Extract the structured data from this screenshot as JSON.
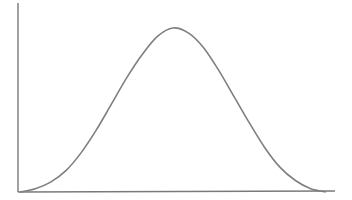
{
  "chart_data": {
    "type": "line",
    "title": "",
    "xlabel": "",
    "ylabel": "",
    "grid": false,
    "legend": null,
    "x": [
      0,
      0.05,
      0.1,
      0.15,
      0.2,
      0.25,
      0.3,
      0.35,
      0.4,
      0.45,
      0.5,
      0.55,
      0.6,
      0.65,
      0.7,
      0.75,
      0.8,
      0.85,
      0.9,
      0.95,
      1.0
    ],
    "series": [
      {
        "name": "curve",
        "values": [
          0.0,
          0.02,
          0.06,
          0.13,
          0.24,
          0.38,
          0.54,
          0.7,
          0.84,
          0.95,
          1.0,
          0.97,
          0.88,
          0.74,
          0.58,
          0.42,
          0.27,
          0.15,
          0.07,
          0.02,
          0.0
        ]
      }
    ],
    "xlim": [
      0,
      1
    ],
    "ylim": [
      0,
      1.2
    ],
    "colors": {
      "axis": "#7a7a7a",
      "curve": "#7f7f7f",
      "background": "#ffffff"
    },
    "plot_area": {
      "origin_x": 18,
      "origin_y": 192,
      "x_axis_end": 335,
      "y_axis_top": 3,
      "curve_start_x": 20,
      "curve_end_x": 326,
      "peak_x": 175,
      "peak_y": 28
    }
  }
}
